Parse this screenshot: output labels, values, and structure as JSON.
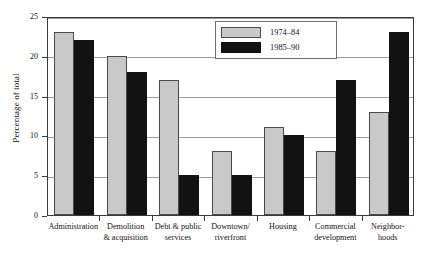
{
  "chart_data": {
    "type": "bar",
    "title": "",
    "subtitle": "",
    "xlabel": "",
    "ylabel": "Percentage of total",
    "ylim": [
      0,
      25
    ],
    "ytick_labels": [
      "0",
      "5",
      "10",
      "15",
      "20",
      "25"
    ],
    "ytick_values": [
      0,
      5,
      10,
      15,
      20,
      25
    ],
    "grid": "horizontal",
    "legend_position": "top-right-inside",
    "categories": [
      "Administration",
      "Demolition & acquisition",
      "Debt & public services",
      "Downtown/ riverfront",
      "Housing",
      "Commercial development",
      "Neighbor- hoods"
    ],
    "category_lines": [
      [
        "Administration",
        ""
      ],
      [
        "Demolition",
        "& acquisition"
      ],
      [
        "Debt & public",
        "services"
      ],
      [
        "Downtown/",
        "riverfront"
      ],
      [
        "Housing",
        ""
      ],
      [
        "Commercial",
        "development"
      ],
      [
        "Neighbor-",
        "hoods"
      ]
    ],
    "series": [
      {
        "name": "1974–84",
        "color": "#c9c9c9",
        "values": [
          23,
          20,
          17,
          8,
          11,
          8,
          13
        ]
      },
      {
        "name": "1985–90",
        "color": "#121212",
        "values": [
          22,
          18,
          5,
          5,
          10,
          17,
          23
        ]
      }
    ]
  },
  "legend": {
    "items": [
      {
        "label": "1974–84",
        "color": "#c9c9c9"
      },
      {
        "label": "1985–90",
        "color": "#121212"
      }
    ]
  }
}
